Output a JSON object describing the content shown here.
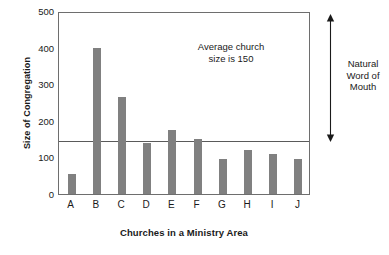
{
  "chart_data": {
    "type": "bar",
    "title": "",
    "xlabel": "Churches in a Ministry Area",
    "ylabel": "Size of Congregation",
    "categories": [
      "A",
      "B",
      "C",
      "D",
      "E",
      "F",
      "G",
      "H",
      "I",
      "J"
    ],
    "values": [
      55,
      400,
      265,
      140,
      175,
      150,
      97,
      120,
      108,
      97
    ],
    "ylim": [
      0,
      500
    ],
    "yticks": [
      0,
      100,
      200,
      300,
      400,
      500
    ],
    "ytick_labels": [
      "0",
      "100",
      "200",
      "300",
      "400",
      "500"
    ],
    "grid": false,
    "legend": "none",
    "bar_color": "#808080",
    "axis_color": "#6e6e6e",
    "annotations": [
      {
        "name": "average-line",
        "kind": "horizontal-reference-line",
        "value": 150,
        "text": "Average church\nsize is 150",
        "line1": "Average church",
        "line2": "size is 150",
        "color": "#5a5a5a"
      },
      {
        "name": "natural-word-of-mouth-arrow",
        "kind": "double-headed-vertical-arrow",
        "from": 150,
        "to": 520,
        "line1": "Natural",
        "line2": "Word of",
        "line3": "Mouth",
        "color": "#1a1a1a"
      }
    ]
  },
  "axes": {
    "y_title": "Size of Congregation",
    "x_title": "Churches in a Ministry Area"
  },
  "annotation_average": {
    "line1": "Average church",
    "line2": "size is 150"
  },
  "annotation_natural": {
    "line1": "Natural",
    "line2": "Word of",
    "line3": "Mouth"
  }
}
